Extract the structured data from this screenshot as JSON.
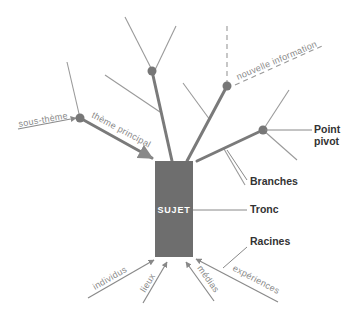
{
  "diagram": {
    "trunk": {
      "label": "SUJET"
    },
    "callouts": {
      "point_pivot_line1": "Point",
      "point_pivot_line2": "pivot",
      "branches": "Branches",
      "tronc": "Tronc",
      "racines": "Racines"
    },
    "branch_labels": {
      "sous_theme": "sous-thème",
      "theme_principal": "thème principal",
      "nouvelle_information": "nouvelle information"
    },
    "root_labels": [
      "individus",
      "lieux",
      "médias",
      "expériences"
    ],
    "colors": {
      "trunk": "#6e6e6e",
      "thick_branch": "#7a7a7a",
      "thin_branch": "#999999",
      "node": "#777777",
      "callout_text": "#333333",
      "italic_text": "#8a8a8a"
    }
  }
}
